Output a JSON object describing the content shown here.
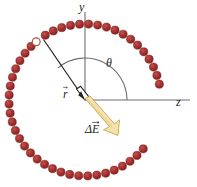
{
  "figure": {
    "kind": "physics-vector-diagram",
    "caption_visible": false,
    "background_color": "#ffffff",
    "axes": {
      "color": "#6e6e72",
      "y_axis": {
        "label": "y",
        "from": [
          85,
          12
        ],
        "to": [
          85,
          100
        ]
      },
      "z_axis": {
        "label": "z",
        "from": [
          85,
          100
        ],
        "to": [
          190,
          100
        ]
      }
    },
    "angle": {
      "label": "θ",
      "arc_color": "#6e6e72",
      "arc_radius": 42,
      "start_deg": 0,
      "end_deg": 130
    },
    "position_vector": {
      "label": "r",
      "has_overbar_arrow": true,
      "color": "#231f20",
      "from": [
        85,
        100
      ],
      "to": [
        42,
        38
      ],
      "angle_deg": 130,
      "endpoint_marker": "open-circle"
    },
    "field_vector": {
      "label": "ΔE",
      "has_overbar_arrow": true,
      "fill_color": "#f2e0a8",
      "edge_color": "#c9a94e",
      "from": [
        85,
        100
      ],
      "to": [
        116,
        133
      ],
      "angle_deg": -47
    },
    "ring": {
      "description": "ring of charged beads",
      "bead_color": "#9e2b2b",
      "bead_highlight_color": "#b8413d",
      "bead_edge_color": "#7c1f1f",
      "bead_count": 46,
      "bead_radius": 4.1,
      "center": [
        85,
        100
      ],
      "ring_radius": 76,
      "gap_start_deg": -40,
      "gap_end_deg": 12,
      "open_bead_index_deg": 130
    }
  },
  "labels": {
    "y": "y",
    "z": "z",
    "theta": "θ",
    "r": "r",
    "delta_e": "ΔE"
  }
}
